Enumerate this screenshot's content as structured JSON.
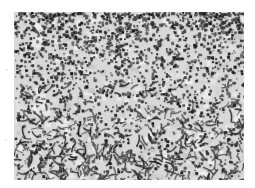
{
  "image": {
    "description": "Grayscale micrograph showing dense dark speckled and acicular particles on a light gray background",
    "colors": {
      "background": "#ffffff",
      "matrix": "#d8d8d8",
      "particle_dark": "#2a2a2a",
      "particle_mid": "#5a5a5a"
    }
  }
}
